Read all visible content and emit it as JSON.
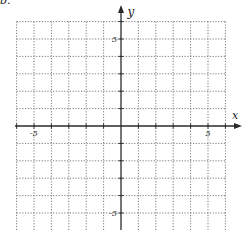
{
  "problem_label": "b.",
  "axes": {
    "x_label": "x",
    "y_label": "y",
    "x_tick_labels": [
      {
        "value": -5,
        "text": "-5"
      },
      {
        "value": 5,
        "text": "5"
      }
    ],
    "y_tick_labels": [
      {
        "value": 5,
        "text": "5"
      },
      {
        "value": -5,
        "text": "-5"
      }
    ]
  },
  "grid": {
    "x_min": -6,
    "x_max": 6,
    "y_min": -6,
    "y_max": 6,
    "step": 1,
    "line_style": "dotted",
    "line_color": "#7a7a7a",
    "axis_color": "#2a2a2a"
  },
  "layout": {
    "origin_px": [
      121,
      126
    ],
    "unit_px": 17.4,
    "x_axis_px": [
      15,
      242
    ],
    "y_axis_px": [
      5,
      230
    ]
  }
}
